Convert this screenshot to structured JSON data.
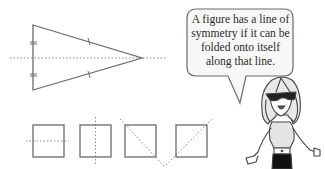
{
  "speech_bubble": {
    "lines": [
      "A figure has a line of",
      "symmetry if it can be",
      "folded onto itself",
      "along that line."
    ]
  },
  "figures": {
    "triangle": {
      "type": "isosceles-triangle",
      "symmetry_line": "horizontal"
    },
    "squares": [
      {
        "symmetry_line": "horizontal"
      },
      {
        "symmetry_line": "vertical"
      },
      {
        "symmetry_line": "diagonal-down"
      },
      {
        "symmetry_line": "diagonal-up"
      }
    ]
  },
  "character": {
    "description": "cartoon girl with sunglasses"
  },
  "colors": {
    "stroke": "#6b6b6b",
    "dotted": "#8a8a8a",
    "bubble_fill": "#f7f7f7"
  }
}
